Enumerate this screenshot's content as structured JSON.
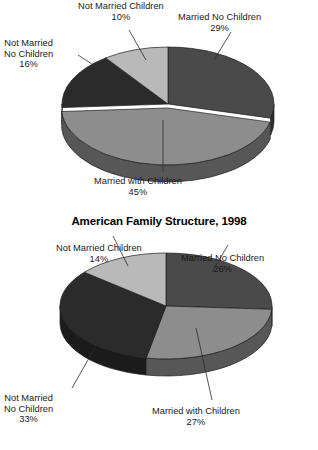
{
  "page": {
    "background": "#ffffff",
    "width": 318,
    "height": 450
  },
  "chart_data": [
    {
      "id": "top-pie",
      "type": "pie",
      "title": "",
      "three_d": true,
      "categories": [
        "Married No Children",
        "Married with Children",
        "Not Married No Children",
        "Not Married Children"
      ],
      "values": [
        29,
        45,
        16,
        10
      ],
      "value_labels": [
        "29%",
        "45%",
        "16%",
        "10%"
      ],
      "colors": [
        "#4a4a4a",
        "#8d8d8d",
        "#2b2b2b",
        "#b9b9b9"
      ],
      "exploded_slice": "Married with Children",
      "legend": "none",
      "labels_position": "callout"
    },
    {
      "id": "bottom-pie",
      "type": "pie",
      "title": "American Family Structure, 1998",
      "three_d": true,
      "categories": [
        "Married No Children",
        "Married with Children",
        "Not Married No Children",
        "Not Married Children"
      ],
      "values": [
        26,
        27,
        33,
        14
      ],
      "value_labels": [
        "26%",
        "27%",
        "33%",
        "14%"
      ],
      "colors": [
        "#4a4a4a",
        "#8d8d8d",
        "#2b2b2b",
        "#b9b9b9"
      ],
      "exploded_slice": "",
      "legend": "none",
      "labels_position": "callout"
    }
  ],
  "top_chart": {
    "labels": {
      "married_no_children": {
        "name": "Married No Children",
        "pct": "29%"
      },
      "married_with_children": {
        "name": "Married with Children",
        "pct": "45%"
      },
      "not_married_no_children_l1": "Not Married",
      "not_married_no_children_l2": "No Children",
      "not_married_no_children_pct": "16%",
      "not_married_children": {
        "name": "Not Married Children",
        "pct": "10%"
      }
    }
  },
  "bottom_chart": {
    "title": "American Family Structure, 1998",
    "labels": {
      "married_no_children": {
        "name": "Married No Children",
        "pct": "26%"
      },
      "married_with_children": {
        "name": "Married with Children",
        "pct": "27%"
      },
      "not_married_no_children_l1": "Not Married",
      "not_married_no_children_l2": "No Children",
      "not_married_no_children_pct": "33%",
      "not_married_children": {
        "name": "Not Married Children",
        "pct": "14%"
      }
    }
  }
}
